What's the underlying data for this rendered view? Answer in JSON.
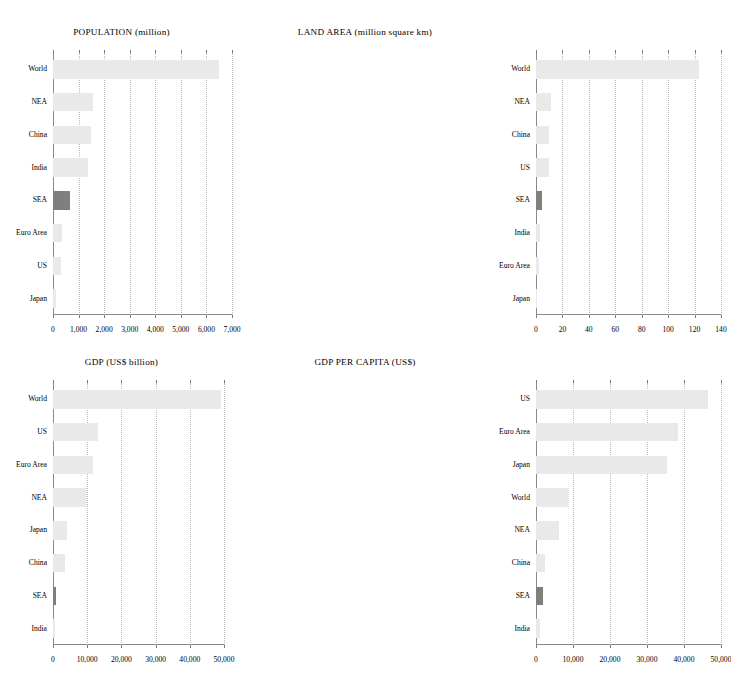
{
  "figure": {
    "background": "#ffffff",
    "bar_color": "#e9e9e9",
    "highlight_color": "#7f7f7f",
    "highlight_category": "SEA"
  },
  "chart_data": [
    {
      "type": "bar",
      "orientation": "horizontal",
      "title": "POPULATION (million)",
      "xlabel": "",
      "ylabel": "",
      "xlim": [
        0,
        7000
      ],
      "xticks": [
        0,
        1000,
        2000,
        3000,
        4000,
        5000,
        6000,
        7000
      ],
      "xtick_labels": [
        "0",
        "1,000",
        "2,000",
        "3,000",
        "4,000",
        "5,000",
        "6,000",
        "7,000"
      ],
      "grid": true,
      "legend": "none",
      "categories": [
        "World",
        "NEA",
        "China",
        "India",
        "SEA",
        "Euro Area",
        "US",
        "Japan"
      ],
      "values": [
        6500,
        1570,
        1490,
        1370,
        660,
        340,
        330,
        127
      ]
    },
    {
      "type": "bar",
      "orientation": "horizontal",
      "title": "LAND AREA (million square km)",
      "xlabel": "",
      "ylabel": "",
      "xlim": [
        0,
        140
      ],
      "xticks": [
        0,
        20,
        40,
        60,
        80,
        100,
        120,
        140
      ],
      "xtick_labels": [
        "0",
        "20",
        "40",
        "60",
        "80",
        "100",
        "120",
        "140"
      ],
      "grid": true,
      "legend": "none",
      "categories": [
        "World",
        "NEA",
        "China",
        "US",
        "SEA",
        "India",
        "Euro Area",
        "Japan"
      ],
      "values": [
        123,
        11,
        10,
        9.8,
        4.5,
        3.3,
        2.6,
        0.4
      ]
    },
    {
      "type": "bar",
      "orientation": "horizontal",
      "title": "GDP (US$ billion)",
      "xlabel": "",
      "ylabel": "",
      "xlim": [
        0,
        50000
      ],
      "xticks": [
        0,
        10000,
        20000,
        30000,
        40000,
        50000
      ],
      "xtick_labels": [
        "0",
        "10,000",
        "20,000",
        "30,000",
        "40,000",
        "50,000"
      ],
      "grid": true,
      "legend": "none",
      "categories": [
        "World",
        "US",
        "Euro Area",
        "NEA",
        "Japan",
        "China",
        "SEA",
        "India"
      ],
      "values": [
        49000,
        13200,
        11700,
        10000,
        4100,
        3500,
        900,
        700
      ]
    },
    {
      "type": "bar",
      "orientation": "horizontal",
      "title": "GDP PER CAPITA (US$)",
      "xlabel": "",
      "ylabel": "",
      "xlim": [
        0,
        50000
      ],
      "xticks": [
        0,
        10000,
        20000,
        30000,
        40000,
        50000
      ],
      "xtick_labels": [
        "0",
        "10,000",
        "20,000",
        "30,000",
        "40,000",
        "50,000"
      ],
      "grid": true,
      "legend": "none",
      "categories": [
        "US",
        "Euro Area",
        "Japan",
        "World",
        "NEA",
        "China",
        "SEA",
        "India"
      ],
      "values": [
        46500,
        38500,
        35500,
        9000,
        6200,
        2500,
        2000,
        1100
      ]
    }
  ]
}
